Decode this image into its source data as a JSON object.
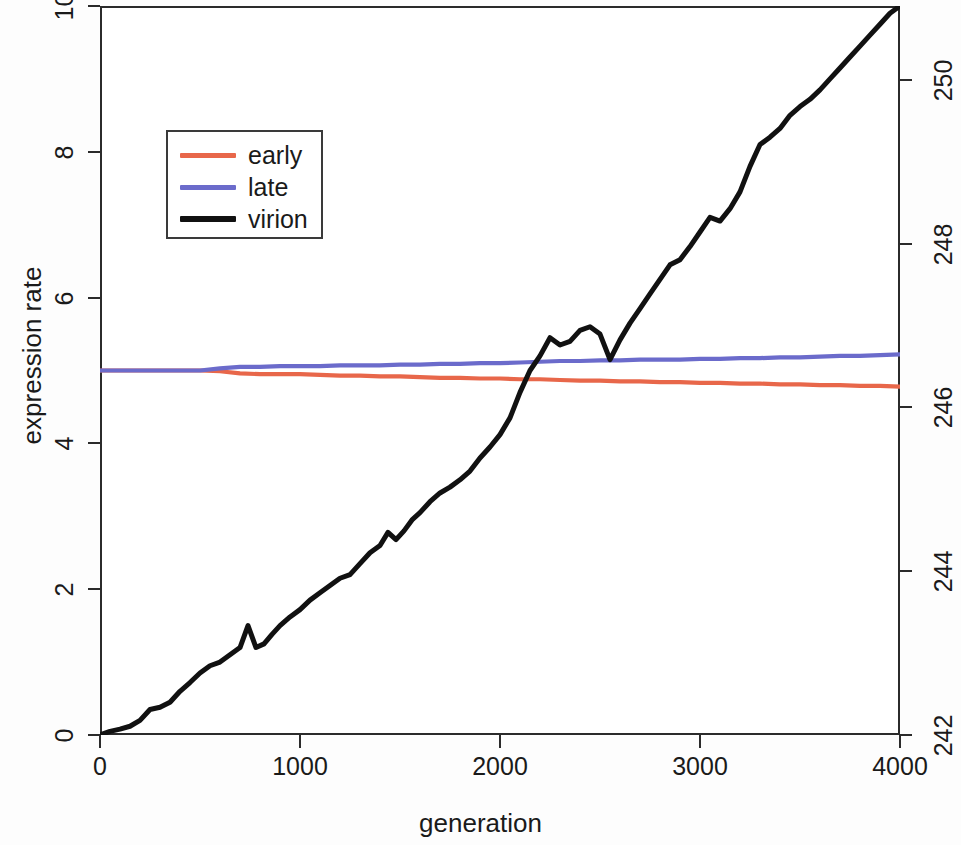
{
  "chart_data": {
    "type": "line",
    "title": "",
    "xlabel": "generation",
    "ylabel": "expression rate",
    "y2label": "",
    "xlim": [
      0,
      4000
    ],
    "ylim": [
      0,
      10
    ],
    "y2lim": [
      242,
      250.9
    ],
    "grid": false,
    "legend_position": "top-left",
    "xticks": [
      "0",
      "1000",
      "2000",
      "3000",
      "4000"
    ],
    "xtick_values": [
      0,
      1000,
      2000,
      3000,
      4000
    ],
    "yticks": [
      "0",
      "2",
      "4",
      "6",
      "8",
      "10"
    ],
    "ytick_values": [
      0,
      2,
      4,
      6,
      8,
      10
    ],
    "y2ticks": [
      "242",
      "244",
      "246",
      "248",
      "250"
    ],
    "y2tick_values": [
      242,
      244,
      246,
      248,
      250
    ],
    "series": [
      {
        "name": "early",
        "color": "#E8674A",
        "axis": "left",
        "x": [
          0,
          100,
          200,
          300,
          400,
          500,
          600,
          700,
          800,
          900,
          1000,
          1100,
          1200,
          1300,
          1400,
          1500,
          1600,
          1700,
          1800,
          1900,
          2000,
          2100,
          2200,
          2300,
          2400,
          2500,
          2600,
          2700,
          2800,
          2900,
          3000,
          3100,
          3200,
          3300,
          3400,
          3500,
          3600,
          3700,
          3800,
          3900,
          4000
        ],
        "values": [
          5.0,
          5.0,
          5.0,
          5.0,
          5.0,
          5.0,
          4.99,
          4.96,
          4.95,
          4.95,
          4.95,
          4.94,
          4.93,
          4.93,
          4.92,
          4.92,
          4.91,
          4.9,
          4.9,
          4.89,
          4.89,
          4.88,
          4.88,
          4.87,
          4.86,
          4.86,
          4.85,
          4.85,
          4.84,
          4.84,
          4.83,
          4.83,
          4.82,
          4.82,
          4.81,
          4.81,
          4.8,
          4.8,
          4.79,
          4.79,
          4.78
        ]
      },
      {
        "name": "late",
        "color": "#6B6BCB",
        "axis": "left",
        "x": [
          0,
          100,
          200,
          300,
          400,
          500,
          600,
          700,
          800,
          900,
          1000,
          1100,
          1200,
          1300,
          1400,
          1500,
          1600,
          1700,
          1800,
          1900,
          2000,
          2100,
          2200,
          2300,
          2400,
          2500,
          2600,
          2700,
          2800,
          2900,
          3000,
          3100,
          3200,
          3300,
          3400,
          3500,
          3600,
          3700,
          3800,
          3900,
          4000
        ],
        "values": [
          5.0,
          5.0,
          5.0,
          5.0,
          5.0,
          5.0,
          5.03,
          5.05,
          5.05,
          5.06,
          5.06,
          5.06,
          5.07,
          5.07,
          5.07,
          5.08,
          5.08,
          5.09,
          5.09,
          5.1,
          5.1,
          5.11,
          5.12,
          5.13,
          5.13,
          5.14,
          5.14,
          5.15,
          5.15,
          5.15,
          5.16,
          5.16,
          5.17,
          5.17,
          5.18,
          5.18,
          5.19,
          5.2,
          5.2,
          5.21,
          5.22
        ]
      },
      {
        "name": "virion",
        "color": "#111111",
        "axis": "right",
        "x": [
          0,
          50,
          100,
          150,
          200,
          250,
          300,
          350,
          400,
          450,
          500,
          550,
          600,
          650,
          700,
          740,
          780,
          820,
          860,
          900,
          950,
          1000,
          1050,
          1100,
          1150,
          1200,
          1250,
          1300,
          1350,
          1400,
          1440,
          1480,
          1520,
          1560,
          1600,
          1650,
          1700,
          1750,
          1800,
          1850,
          1900,
          1950,
          2000,
          2050,
          2100,
          2150,
          2200,
          2250,
          2300,
          2350,
          2400,
          2450,
          2500,
          2550,
          2600,
          2650,
          2700,
          2750,
          2800,
          2850,
          2900,
          2950,
          3000,
          3050,
          3100,
          3150,
          3200,
          3250,
          3300,
          3350,
          3400,
          3450,
          3500,
          3550,
          3600,
          3650,
          3700,
          3750,
          3800,
          3850,
          3900,
          3950,
          4000
        ],
        "values": [
          0.0,
          0.05,
          0.08,
          0.12,
          0.2,
          0.35,
          0.38,
          0.45,
          0.6,
          0.72,
          0.85,
          0.95,
          1.0,
          1.1,
          1.2,
          1.5,
          1.2,
          1.25,
          1.38,
          1.5,
          1.62,
          1.72,
          1.85,
          1.95,
          2.05,
          2.15,
          2.2,
          2.35,
          2.5,
          2.6,
          2.78,
          2.68,
          2.8,
          2.95,
          3.05,
          3.2,
          3.32,
          3.4,
          3.5,
          3.62,
          3.8,
          3.95,
          4.12,
          4.35,
          4.7,
          5.0,
          5.2,
          5.45,
          5.35,
          5.4,
          5.55,
          5.6,
          5.5,
          5.15,
          5.42,
          5.65,
          5.85,
          6.05,
          6.25,
          6.45,
          6.52,
          6.7,
          6.9,
          7.1,
          7.05,
          7.22,
          7.45,
          7.8,
          8.1,
          8.2,
          8.32,
          8.5,
          8.62,
          8.72,
          8.85,
          9.0,
          9.15,
          9.3,
          9.45,
          9.6,
          9.75,
          9.9,
          10.0
        ]
      }
    ]
  },
  "axes": {
    "y_left": {
      "title": "expression rate",
      "ticks": [
        "0",
        "2",
        "4",
        "6",
        "8",
        "10"
      ]
    },
    "y_right": {
      "title": "",
      "ticks": [
        "242",
        "244",
        "246",
        "248",
        "250"
      ]
    },
    "x": {
      "title": "generation",
      "ticks": [
        "0",
        "1000",
        "2000",
        "3000",
        "4000"
      ]
    }
  },
  "legend": {
    "items": [
      {
        "label": "early",
        "color": "#E8674A"
      },
      {
        "label": "late",
        "color": "#6B6BCB"
      },
      {
        "label": "virion",
        "color": "#111111"
      }
    ]
  }
}
